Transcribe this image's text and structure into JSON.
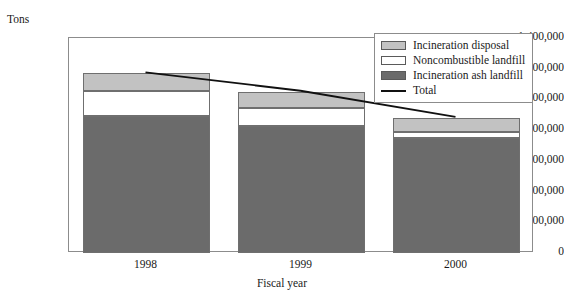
{
  "chart_data": {
    "type": "bar",
    "subtype": "stacked-bar-with-line",
    "title": "",
    "xlabel": "Fiscal year",
    "ylabel": "Tons",
    "categories": [
      "1998",
      "1999",
      "2000"
    ],
    "ylim": [
      0,
      1400000
    ],
    "ytick_step": 200000,
    "ytick_labels": [
      "0",
      "200,000",
      "400,000",
      "600,000",
      "800,000",
      "1,000,000",
      "1,200,000",
      "1,400,000"
    ],
    "ytick_values": [
      0,
      200000,
      400000,
      600000,
      800000,
      1000000,
      1200000,
      1400000
    ],
    "grid": false,
    "legend_position": "top-right",
    "stack_order_bottom_to_top": [
      "Incineration ash landfill",
      "Noncombustible landfill",
      "Incineration disposal"
    ],
    "series": [
      {
        "name": "Incineration ash landfill",
        "type": "bar",
        "color": "#6b6b6b",
        "values": [
          890000,
          825000,
          750000
        ]
      },
      {
        "name": "Noncombustible landfill",
        "type": "bar",
        "color": "#ffffff",
        "values": [
          165000,
          120000,
          40000
        ]
      },
      {
        "name": "Incineration disposal",
        "type": "bar",
        "color": "#c2c2c2",
        "values": [
          115000,
          105000,
          90000
        ]
      },
      {
        "name": "Total",
        "type": "line",
        "color": "#111111",
        "values": [
          1170000,
          1050000,
          880000
        ]
      }
    ]
  },
  "legend": {
    "items": [
      {
        "label": "Incineration disposal",
        "marker": "swatch",
        "color": "#c2c2c2"
      },
      {
        "label": "Noncombustible landfill",
        "marker": "swatch",
        "color": "#ffffff"
      },
      {
        "label": "Incineration ash landfill",
        "marker": "swatch",
        "color": "#6b6b6b"
      },
      {
        "label": "Total",
        "marker": "line",
        "color": "#111111"
      }
    ]
  },
  "axes": {
    "y_unit_caption": "Tons",
    "x_title": "Fiscal year"
  }
}
